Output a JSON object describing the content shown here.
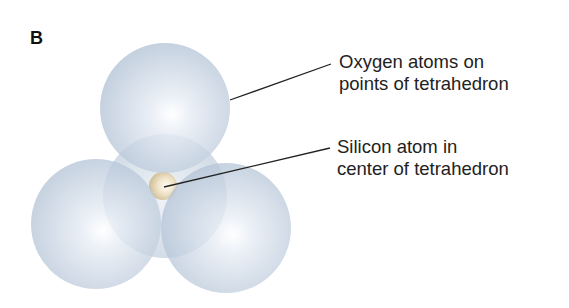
{
  "panel": {
    "letter": "B"
  },
  "labels": {
    "oxygen": {
      "line1": "Oxygen atoms on",
      "line2": "points of tetrahedron"
    },
    "silicon": {
      "line1": "Silicon atom in",
      "line2": "center of tetrahedron"
    }
  },
  "colors": {
    "oxygen_sphere": "#b9c8da",
    "oxygen_highlight": "#ffffff",
    "silicon_atom": "#e8d9b8",
    "leader_line": "#222222"
  },
  "atoms": {
    "oxygen": [
      {
        "name": "top",
        "cx": 165,
        "cy": 108,
        "r": 65
      },
      {
        "name": "back",
        "cx": 165,
        "cy": 196,
        "r": 62
      },
      {
        "name": "left",
        "cx": 96,
        "cy": 224,
        "r": 65
      },
      {
        "name": "right",
        "cx": 226,
        "cy": 228,
        "r": 65
      }
    ],
    "silicon": {
      "cx": 163,
      "cy": 186,
      "r": 14
    }
  }
}
